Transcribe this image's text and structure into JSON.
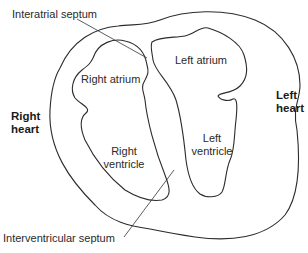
{
  "diagram": {
    "labels": {
      "interatrial_septum": "Interatrial septum",
      "right_atrium": "Right atrium",
      "left_atrium": "Left atrium",
      "right_ventricle_line1": "Right",
      "right_ventricle_line2": "ventricle",
      "left_ventricle_line1": "Left",
      "left_ventricle_line2": "ventricle",
      "right_heart_line1": "Right",
      "right_heart_line2": "heart",
      "left_heart_line1": "Left",
      "left_heart_line2": "heart",
      "interventricular_septum": "Interventricular septum"
    },
    "colors": {
      "stroke": "#2b2b2b",
      "text": "#2a2a2a",
      "background": "#ffffff"
    }
  }
}
